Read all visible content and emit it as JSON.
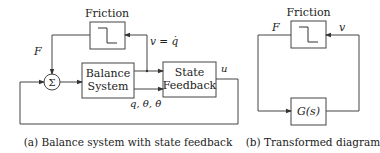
{
  "figure_a": {
    "friction_label": "Friction",
    "force_label": "F",
    "velocity_label": "v = q̇",
    "sum_symbol": "Σ",
    "balance_system_line1": "Balance",
    "balance_system_line2": "System",
    "state_feedback_line1": "State",
    "state_feedback_line2": "Feedback",
    "control_label": "u",
    "states_label": "q, θ, θ̇",
    "caption": "(a) Balance system with state feedback"
  },
  "figure_b": {
    "friction_label": "Friction",
    "force_label": "F",
    "velocity_label": "v",
    "transfer_label": "G(s)",
    "caption": "(b) Transformed diagram"
  },
  "colors": {
    "stroke": "#444444",
    "text": "#222222",
    "background": "#ffffff"
  }
}
